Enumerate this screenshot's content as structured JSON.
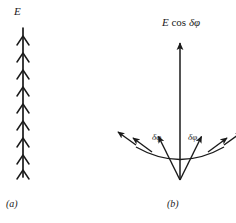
{
  "figure": {
    "background_color": "#ffffff",
    "ink_color": "#1a1a1a",
    "width": 236,
    "height": 223
  },
  "panel_a": {
    "caption": "(a)",
    "field_label": "E",
    "description": "vertical field line with stacked chevron arrowheads",
    "axis": {
      "x": 23,
      "y_top": 28,
      "y_bottom": 177
    },
    "chevron_count": 9,
    "chevron_y_positions": [
      36,
      53,
      70,
      87,
      104,
      121,
      138,
      155,
      170
    ],
    "chevron_half_width": 6,
    "chevron_height": 9
  },
  "panel_b": {
    "caption": "(b)",
    "resultant_label": {
      "amplitude": "E",
      "operator": "cos",
      "angle": "δφ"
    },
    "angle_label_left": "δφ",
    "angle_label_right": "δφ",
    "apex": {
      "x": 180,
      "y": 180
    },
    "resultant": {
      "name": "E cos dphi",
      "tip_x": 180,
      "tip_y": 40,
      "angle_deg": 0,
      "length": 140
    },
    "phasors": [
      {
        "name": "outer-left",
        "angle_deg": -52,
        "length": 82,
        "tip_x": 115,
        "tip_y": 130
      },
      {
        "name": "inner-left",
        "angle_deg": -27,
        "length": 52,
        "tip_x": 156,
        "tip_y": 133
      },
      {
        "name": "inner-right",
        "angle_deg": 27,
        "length": 52,
        "tip_x": 204,
        "tip_y": 133
      },
      {
        "name": "outer-right",
        "angle_deg": 52,
        "length": 82,
        "tip_x": 245,
        "tip_y": 130
      }
    ],
    "arc": {
      "radius": 56,
      "start_angle_deg": -52,
      "end_angle_deg": 52
    }
  }
}
